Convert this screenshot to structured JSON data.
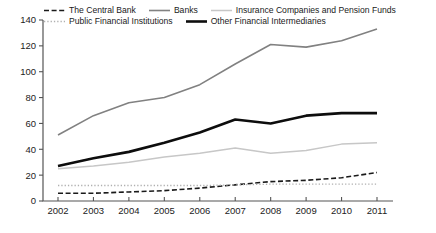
{
  "chart_data": {
    "type": "line",
    "title": "",
    "xlabel": "",
    "ylabel": "",
    "categories": [
      "2002",
      "2003",
      "2004",
      "2005",
      "2006",
      "2007",
      "2008",
      "2009",
      "2010",
      "2011"
    ],
    "ylim": [
      0,
      140
    ],
    "yticks": [
      0,
      20,
      40,
      60,
      80,
      100,
      120,
      140
    ],
    "grid": false,
    "legend_position": "top",
    "series": [
      {
        "name": "The Central Bank",
        "style": "dashed",
        "color": "#1a1a1a",
        "width": 1.6,
        "values": [
          6,
          6,
          7,
          8,
          10,
          12.5,
          15,
          16,
          18,
          22
        ]
      },
      {
        "name": "Banks",
        "style": "solid",
        "color": "#818181",
        "width": 1.6,
        "values": [
          51,
          66,
          76,
          80,
          90,
          106,
          121,
          119,
          124,
          133
        ]
      },
      {
        "name": "Insurance Companies and Pension Funds",
        "style": "solid",
        "color": "#c7c7c7",
        "width": 1.5,
        "values": [
          25,
          27,
          30,
          34,
          37,
          41,
          37,
          39,
          44,
          45
        ]
      },
      {
        "name": "Public Financial Institutions",
        "style": "dotted",
        "color": "#b0b0b0",
        "width": 1.3,
        "values": [
          12,
          12,
          12,
          12,
          12,
          12.5,
          13,
          13,
          13,
          13
        ]
      },
      {
        "name": "Other Financial Intermediaries",
        "style": "solid",
        "color": "#0d0d0d",
        "width": 2.6,
        "values": [
          27,
          33,
          38,
          45,
          53,
          63,
          60,
          66,
          68,
          68
        ]
      }
    ],
    "legend_rows": [
      [
        0,
        1,
        2
      ],
      [
        3,
        4
      ]
    ],
    "axis_color": "#555555",
    "tick_font_px": 9.5
  }
}
